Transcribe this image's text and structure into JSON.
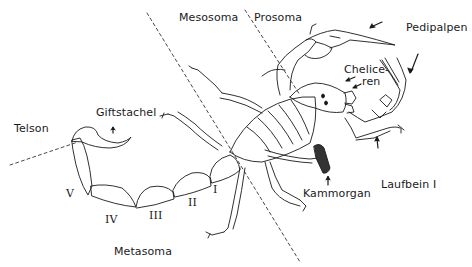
{
  "diagram": {
    "regions": {
      "mesosoma": "Mesosoma",
      "prosoma": "Prosoma",
      "metasoma": "Metasoma"
    },
    "labels": {
      "telson": "Telson",
      "giftstachel": "Giftstachel",
      "pedipalpen": "Pedipalpen",
      "chelice_line1": "Chelice-",
      "chelice_line2": "ren",
      "kammorgan": "Kammorgan",
      "laufbein": "Laufbein I"
    },
    "metasoma_segments": [
      "I",
      "II",
      "III",
      "IV",
      "V"
    ],
    "colors": {
      "line": "#1a1a1a",
      "background": "#ffffff",
      "comb_organ_fill": "#333333"
    }
  }
}
